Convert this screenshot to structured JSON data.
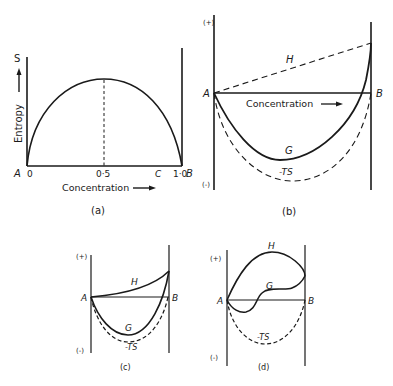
{
  "figure": {
    "panels": [
      {
        "id": "a",
        "caption": "(a)",
        "y_axis_symbol": "S",
        "y_axis_label": "Entropy",
        "x_axis_label": "Concentration",
        "left_end_label": "A",
        "right_end_label": "B",
        "x_ticks": [
          "0",
          "0·5",
          "1·0"
        ],
        "marker_label": "C",
        "curve": "entropy of mixing, maximum at 0·5"
      },
      {
        "id": "b",
        "caption": "(b)",
        "plus_label": "(+)",
        "minus_label": "(-)",
        "left_end_label": "A",
        "right_end_label": "B",
        "axis_text": "Concentration",
        "curves": {
          "H": "H",
          "G": "G",
          "TS": "-TS"
        }
      },
      {
        "id": "c",
        "caption": "(c)",
        "plus_label": "(+)",
        "minus_label": "(-)",
        "left_end_label": "A",
        "right_end_label": "B",
        "curves": {
          "H": "H",
          "G": "G",
          "TS": "-TS"
        }
      },
      {
        "id": "d",
        "caption": "(d)",
        "plus_label": "(+)",
        "minus_label": "(-)",
        "left_end_label": "A",
        "right_end_label": "B",
        "curves": {
          "H": "H",
          "G": "G",
          "TS": "-TS"
        }
      }
    ],
    "colors": {
      "ink": "#1a1a1a",
      "background": "#ffffff"
    }
  }
}
